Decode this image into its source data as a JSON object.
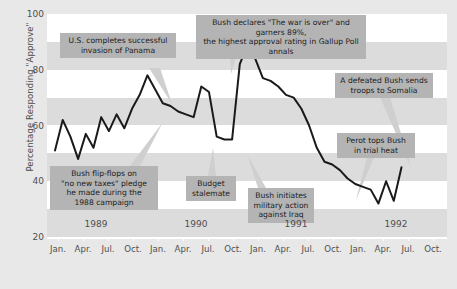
{
  "chart_data": {
    "type": "line",
    "title": "",
    "subtitle": "",
    "xlabel": "",
    "ylabel": "Percentage Responding \"Approve\"",
    "ylim": [
      20,
      100
    ],
    "yticks": [
      20,
      40,
      60,
      80,
      100
    ],
    "xlim": [
      "1989-01",
      "1992-10"
    ],
    "grid": false,
    "legend_position": "none",
    "banded_background": true,
    "x_tick_labels": [
      "Jan.",
      "Apr.",
      "Jul.",
      "Oct.",
      "Jan.",
      "Apr.",
      "Jul.",
      "Oct.",
      "Jan.",
      "Apr.",
      "Jul.",
      "Oct.",
      "Jan.",
      "Apr.",
      "Jul.",
      "Oct."
    ],
    "x_group_labels": [
      "1989",
      "1990",
      "1991",
      "1992"
    ],
    "series": [
      {
        "name": "Presidential Approval",
        "color": "#1a1a1a",
        "x": [
          "1989-01",
          "1989-02",
          "1989-03",
          "1989-04",
          "1989-05",
          "1989-06",
          "1989-07",
          "1989-08",
          "1989-09",
          "1989-10",
          "1989-11",
          "1989-12",
          "1990-01",
          "1990-02",
          "1990-03",
          "1990-04",
          "1990-05",
          "1990-06",
          "1990-07",
          "1990-08",
          "1990-09",
          "1990-10",
          "1990-11",
          "1990-12",
          "1991-01",
          "1991-02",
          "1991-03",
          "1991-04",
          "1991-05",
          "1991-06",
          "1991-07",
          "1991-08",
          "1991-09",
          "1991-10",
          "1991-11",
          "1991-12",
          "1992-01",
          "1992-02",
          "1992-03",
          "1992-04",
          "1992-05",
          "1992-06",
          "1992-07",
          "1992-08",
          "1992-09",
          "1992-10"
        ],
        "values": [
          51,
          62,
          56,
          48,
          57,
          52,
          63,
          58,
          64,
          59,
          66,
          71,
          78,
          73,
          68,
          67,
          65,
          64,
          63,
          74,
          72,
          56,
          55,
          55,
          82,
          89,
          84,
          77,
          76,
          74,
          71,
          70,
          66,
          60,
          52,
          47,
          46,
          44,
          41,
          39,
          38,
          37,
          32,
          40,
          33,
          45
        ],
        "marker": "none",
        "linewidth": 2
      }
    ],
    "annotations": [
      {
        "id": "panama",
        "text": "U.S. completes successful\ninvasion of Panama"
      },
      {
        "id": "war-over",
        "text": "Bush declares \"The war is over\" and garners 89%,\nthe highest approval rating in Gallup Poll annals"
      },
      {
        "id": "somalia",
        "text": "A defeated Bush sends\ntroops to Somalia"
      },
      {
        "id": "perot",
        "text": "Perot tops Bush\nin trial heat"
      },
      {
        "id": "flipflop",
        "text": "Bush flip-flops on\n\"no new taxes\" pledge\nhe made during the\n1988 campaign"
      },
      {
        "id": "budget",
        "text": "Budget\nstalemate"
      },
      {
        "id": "iraq",
        "text": "Bush initiates\nmilitary action\nagainst Iraq"
      }
    ],
    "colors": {
      "page_background": "#e8e8e8",
      "plot_background": "#ffffff",
      "band": "#dcdcdc",
      "line": "#1a1a1a",
      "callout_background": "#b4b4b4",
      "text": "#4f4f4f"
    }
  }
}
